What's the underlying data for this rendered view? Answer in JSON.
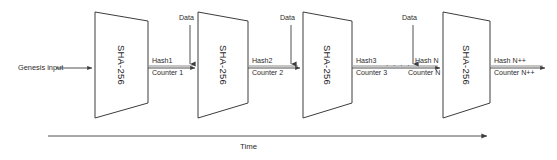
{
  "diagram": {
    "stroke_color": "#3d3d3d",
    "text_color": "#2b2b2b",
    "background": "#ffffff",
    "genesis_label": "Genesis input",
    "time_axis_label": "Time",
    "ellipsis": "· · · ·",
    "blocks": [
      {
        "label": "SHA-256"
      },
      {
        "label": "SHA-256"
      },
      {
        "label": "SHA-256"
      },
      {
        "label": "SHA-256"
      }
    ],
    "data_inputs": [
      {
        "label": "Data"
      },
      {
        "label": "Data"
      },
      {
        "label": "Data"
      }
    ],
    "links": [
      {
        "hash": "Hash1",
        "counter": "Counter 1"
      },
      {
        "hash": "Hash2",
        "counter": "Counter 2"
      },
      {
        "hash": "Hash3",
        "counter": "Counter 3"
      },
      {
        "hash": "Hash N",
        "counter": "Counter N"
      },
      {
        "hash": "Hash N++",
        "counter": "Counter N++"
      }
    ]
  }
}
